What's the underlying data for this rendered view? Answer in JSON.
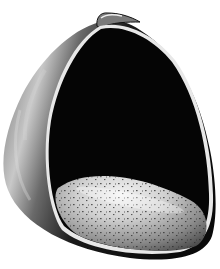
{
  "image": {
    "subject": "Slipper shell illustration (interior view with shelf)",
    "alt": "Black-and-white drawing of a cup-shaped shell showing dark interior and speckled lit shelf",
    "colors": {
      "background": "#ffffff",
      "interior": "#050505",
      "outer_dark": "#1a1a1a",
      "outer_light": "#bdbdbd",
      "rim": "#e8e8e8",
      "shelf_light": "#f0f0f0",
      "shelf_mid": "#8a8a8a",
      "speckle": "#2a2a2a"
    }
  }
}
